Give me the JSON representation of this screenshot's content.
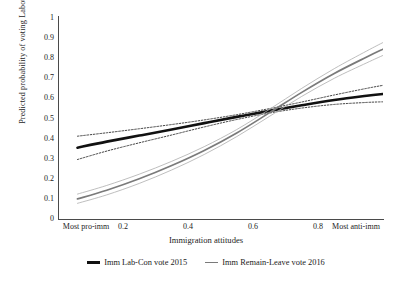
{
  "chart_data": {
    "type": "line",
    "title": "",
    "xlabel": "Immigration attitudes",
    "ylabel": "Predicted probability of voting Labour/Remain",
    "xlim": [
      0,
      1
    ],
    "ylim": [
      0,
      1
    ],
    "grid": false,
    "legend_position": "bottom",
    "x_tick_values": [
      0,
      0.2,
      0.4,
      0.6,
      0.8,
      1
    ],
    "x_tick_labels": [
      "Most pro-imm",
      "0.2",
      "0.4",
      "0.6",
      "0.8",
      "Most anti-imm"
    ],
    "y_tick_values": [
      0,
      0.1,
      0.2,
      0.3,
      0.4,
      0.5,
      0.6,
      0.7,
      0.8,
      0.9,
      1
    ],
    "y_tick_labels": [
      "0",
      "0.1",
      "0.2",
      "0.3",
      "0.4",
      "0.5",
      "0.6",
      "0.7",
      "0.8",
      "0.9",
      "1"
    ],
    "x": [
      0.06,
      0.15,
      0.25,
      0.35,
      0.45,
      0.55,
      0.65,
      0.75,
      0.85,
      0.95,
      1.0
    ],
    "series": [
      {
        "name": "Imm Lab-Con vote 2015",
        "color": "#111111",
        "style": "solid-thick",
        "values": [
          0.355,
          0.385,
          0.415,
          0.445,
          0.477,
          0.508,
          0.538,
          0.566,
          0.592,
          0.613,
          0.622
        ],
        "ci_upper": {
          "style": "dotted",
          "values": [
            0.412,
            0.429,
            0.449,
            0.47,
            0.493,
            0.519,
            0.549,
            0.582,
            0.617,
            0.65,
            0.665
          ]
        },
        "ci_lower": {
          "style": "dotted",
          "values": [
            0.296,
            0.338,
            0.379,
            0.418,
            0.458,
            0.495,
            0.527,
            0.552,
            0.57,
            0.58,
            0.583
          ]
        }
      },
      {
        "name": "Imm Remain-Leave vote 2016",
        "color": "#7a7a7a",
        "style": "solid",
        "values": [
          0.1,
          0.143,
          0.2,
          0.266,
          0.341,
          0.428,
          0.528,
          0.63,
          0.724,
          0.806,
          0.845
        ],
        "ci_upper": {
          "style": "thin",
          "values": [
            0.124,
            0.167,
            0.223,
            0.287,
            0.36,
            0.445,
            0.545,
            0.65,
            0.748,
            0.836,
            0.878
          ]
        },
        "ci_lower": {
          "style": "thin",
          "values": [
            0.078,
            0.12,
            0.177,
            0.244,
            0.321,
            0.41,
            0.51,
            0.61,
            0.7,
            0.777,
            0.814
          ]
        }
      }
    ],
    "annotations": {
      "crossing_point": {
        "x": 0.58,
        "y": 0.535
      }
    }
  },
  "legend": {
    "items": [
      {
        "label": "Imm Lab-Con vote 2015",
        "color": "#111111"
      },
      {
        "label": "Imm Remain-Leave vote 2016",
        "color": "#7a7a7a"
      }
    ]
  }
}
